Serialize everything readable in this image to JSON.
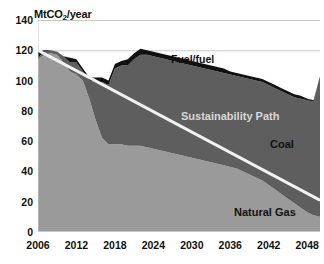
{
  "chart_data": {
    "type": "area",
    "title": "",
    "subtitle": "",
    "ylabel": "MtCO2/year",
    "ylabel_parts": {
      "pre": "MtCO",
      "sub": "2",
      "post": "/year"
    },
    "xlabel": "",
    "ylim": [
      0,
      140
    ],
    "xlim": [
      2006,
      2050
    ],
    "grid": "horizontal-gridlines-at-140-and-120",
    "legend": "inline-area-labels",
    "ytick_labels": [
      "140",
      "120",
      "100",
      "80",
      "60",
      "40",
      "20",
      "0"
    ],
    "ytick_values": [
      140,
      120,
      100,
      80,
      60,
      40,
      20,
      0
    ],
    "xtick_labels": [
      "2006",
      "2012",
      "2018",
      "2024",
      "2030",
      "2036",
      "2042",
      "2048"
    ],
    "xtick_values": [
      2006,
      2012,
      2018,
      2024,
      2030,
      2036,
      2042,
      2048
    ],
    "x": [
      2006,
      2007,
      2008,
      2009,
      2010,
      2011,
      2012,
      2013,
      2014,
      2015,
      2016,
      2017,
      2018,
      2019,
      2020,
      2021,
      2022,
      2023,
      2024,
      2025,
      2026,
      2027,
      2028,
      2029,
      2030,
      2031,
      2032,
      2033,
      2034,
      2035,
      2036,
      2037,
      2038,
      2039,
      2040,
      2041,
      2042,
      2043,
      2044,
      2045,
      2046,
      2047,
      2048,
      2049,
      2050
    ],
    "stacking": "bottom-to-top: Natural Gas, Coal, Fuel/fuel",
    "series": [
      {
        "name": "Natural Gas",
        "color": "#9a9a9a",
        "values": [
          114,
          117,
          118,
          117,
          112,
          106,
          104,
          100,
          88,
          74,
          62,
          58,
          58,
          58,
          57,
          57,
          57,
          56,
          55,
          54,
          53,
          52,
          51,
          50,
          49,
          48,
          47,
          46,
          45,
          44,
          43,
          42,
          40,
          38,
          36,
          34,
          31,
          28,
          25,
          22,
          19,
          16,
          13,
          11,
          10
        ]
      },
      {
        "name": "Coal",
        "color": "#5e5e5e",
        "values": [
          1,
          2,
          2,
          2,
          4,
          6,
          8,
          6,
          12,
          25,
          37,
          39,
          50,
          52,
          53,
          57,
          60,
          61,
          61,
          61,
          61,
          61,
          61,
          61,
          61,
          61,
          61,
          61,
          61,
          61,
          61,
          61,
          62,
          63,
          64,
          65,
          66,
          67,
          68,
          69,
          70,
          72,
          74,
          75,
          93
        ]
      },
      {
        "name": "Fuel/fuel",
        "color": "#111111",
        "values": [
          4,
          1,
          0,
          0,
          0,
          3,
          2,
          2,
          2,
          3,
          3,
          3,
          3,
          3,
          4,
          4,
          4,
          3,
          3,
          3,
          3,
          3,
          3,
          3,
          3,
          3,
          3,
          3,
          3,
          3,
          2,
          2,
          2,
          2,
          2,
          2,
          2,
          2,
          2,
          2,
          2,
          2,
          1,
          1,
          0
        ]
      }
    ],
    "totals": [
      119,
      120,
      120,
      119,
      116,
      115,
      114,
      108,
      102,
      102,
      102,
      100,
      111,
      113,
      114,
      118,
      121,
      120,
      119,
      118,
      117,
      116,
      115,
      114,
      113,
      112,
      111,
      110,
      109,
      108,
      106,
      105,
      104,
      103,
      102,
      101,
      99,
      97,
      95,
      93,
      91,
      90,
      88,
      87,
      103
    ],
    "overlay_line": {
      "name": "Sustainability Path",
      "color": "#f2f2f2",
      "x": [
        2006,
        2050
      ],
      "values": [
        120,
        21
      ]
    },
    "annotations": [
      {
        "name": "fuel-fuel-label",
        "text": "Fuel/fuel",
        "color": "#111111"
      },
      {
        "name": "sustainability-path-label",
        "text": "Sustainability Path",
        "color": "#d8d8d8"
      },
      {
        "name": "coal-label",
        "text": "Coal",
        "color": "#111111"
      },
      {
        "name": "natural-gas-label",
        "text": "Natural Gas",
        "color": "#111111"
      }
    ]
  },
  "colors": {
    "natural_gas": "#9a9a9a",
    "coal": "#5e5e5e",
    "fuel_fuel": "#111111",
    "sustainability_path": "#f2f2f2",
    "gridline": "#c9c9c9",
    "background": "#ffffff",
    "text": "#111111"
  }
}
